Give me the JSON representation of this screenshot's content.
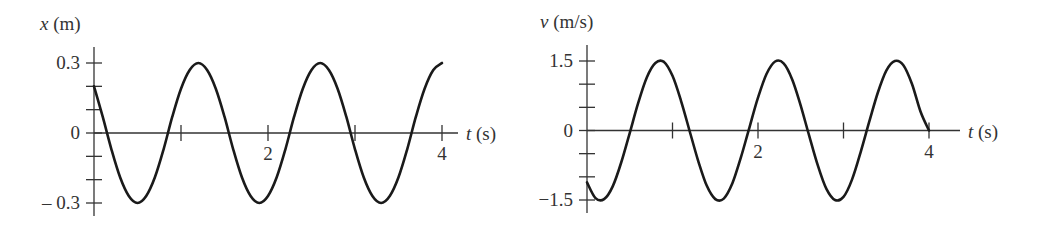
{
  "chart_data": [
    {
      "type": "line",
      "title": "",
      "ylabel_var": "x",
      "ylabel_unit": " (m)",
      "xlabel_var": "t",
      "xlabel_unit": " (s)",
      "xlim": [
        0,
        4
      ],
      "ylim": [
        -0.3,
        0.3
      ],
      "x_ticks": [
        1,
        2,
        3,
        4
      ],
      "x_tick_labels": {
        "2": "2",
        "4": "4"
      },
      "y_ticks": [
        -0.3,
        -0.2,
        -0.1,
        0,
        0.1,
        0.2,
        0.3
      ],
      "y_tick_labels": {
        "0.3": "0.3",
        "0": "0",
        "-0.3": "– 0.3"
      },
      "grid": false,
      "series": [
        {
          "name": "x(t)",
          "color": "#1a1a1a",
          "x": [
            0,
            0.1,
            0.2,
            0.3,
            0.4,
            0.5,
            0.6,
            0.7,
            0.8,
            0.9,
            1.0,
            1.1,
            1.2,
            1.3,
            1.4,
            1.5,
            1.6,
            1.7,
            1.8,
            1.9,
            2.0,
            2.1,
            2.2,
            2.3,
            2.4,
            2.5,
            2.6,
            2.7,
            2.8,
            2.9,
            3.0,
            3.1,
            3.2,
            3.3,
            3.4,
            3.5,
            3.6,
            3.7,
            3.8,
            3.9,
            4.0
          ],
          "y": [
            0.2,
            0.07,
            -0.07,
            -0.19,
            -0.27,
            -0.3,
            -0.27,
            -0.19,
            -0.07,
            0.07,
            0.19,
            0.27,
            0.3,
            0.27,
            0.19,
            0.07,
            -0.07,
            -0.19,
            -0.27,
            -0.3,
            -0.27,
            -0.19,
            -0.07,
            0.07,
            0.19,
            0.27,
            0.3,
            0.27,
            0.19,
            0.07,
            -0.07,
            -0.19,
            -0.27,
            -0.3,
            -0.27,
            -0.19,
            -0.07,
            0.07,
            0.19,
            0.27,
            0.3
          ]
        }
      ]
    },
    {
      "type": "line",
      "title": "",
      "ylabel_var": "v",
      "ylabel_unit": " (m/s)",
      "xlabel_var": "t",
      "xlabel_unit": " (s)",
      "xlim": [
        0,
        4
      ],
      "ylim": [
        -1.5,
        1.5
      ],
      "x_ticks": [
        1,
        2,
        3,
        4
      ],
      "x_tick_labels": {
        "2": "2",
        "4": "4"
      },
      "y_ticks": [
        -1.5,
        -1.0,
        -0.5,
        0,
        0.5,
        1.0,
        1.5
      ],
      "y_tick_labels": {
        "1.5": "1.5",
        "0": "0",
        "-1.5": "−1.5"
      },
      "grid": false,
      "series": [
        {
          "name": "v(t)",
          "color": "#1a1a1a",
          "x": [
            0,
            0.1,
            0.2,
            0.3,
            0.4,
            0.5,
            0.6,
            0.7,
            0.8,
            0.9,
            1.0,
            1.1,
            1.2,
            1.3,
            1.4,
            1.5,
            1.6,
            1.7,
            1.8,
            1.9,
            2.0,
            2.1,
            2.2,
            2.3,
            2.4,
            2.5,
            2.6,
            2.7,
            2.8,
            2.9,
            3.0,
            3.1,
            3.2,
            3.3,
            3.4,
            3.5,
            3.6,
            3.7,
            3.8,
            3.9,
            4.0
          ],
          "y": [
            -1.12,
            -1.46,
            -1.48,
            -1.21,
            -0.69,
            -0.05,
            0.6,
            1.15,
            1.46,
            1.48,
            1.18,
            0.64,
            -0.01,
            -0.65,
            -1.19,
            -1.48,
            -1.47,
            -1.14,
            -0.58,
            0.07,
            0.71,
            1.22,
            1.49,
            1.45,
            1.1,
            0.53,
            -0.12,
            -0.76,
            -1.26,
            -1.5,
            -1.43,
            -1.06,
            -0.47,
            0.18,
            0.81,
            1.29,
            1.5,
            1.41,
            1.01,
            0.41,
            0.0
          ]
        }
      ]
    }
  ]
}
